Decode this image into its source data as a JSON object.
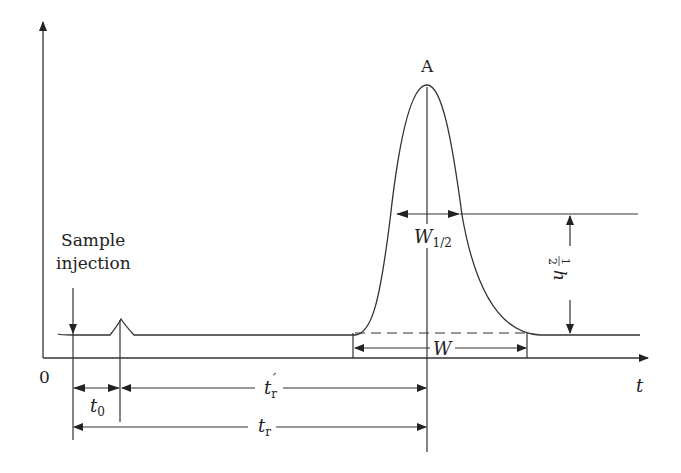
{
  "diagram": {
    "type": "chromatogram",
    "axes": {
      "origin_label": "0",
      "x_label": "t"
    },
    "annotations": {
      "peak_label": "A",
      "injection_label_line1": "Sample",
      "injection_label_line2": "injection",
      "half_width_label": "W",
      "half_width_sub": "1/2",
      "base_width_label": "W",
      "half_height_label_num": "1",
      "half_height_label_den": "2",
      "half_height_label_var": "h",
      "dead_time_label": "t",
      "dead_time_sub": "0",
      "adjusted_retention_label": "t",
      "adjusted_retention_sub": "r",
      "adjusted_retention_prime": "′",
      "retention_label": "t",
      "retention_sub": "r"
    },
    "colors": {
      "line": "#333333",
      "text": "#222222",
      "background": "#ffffff"
    }
  }
}
